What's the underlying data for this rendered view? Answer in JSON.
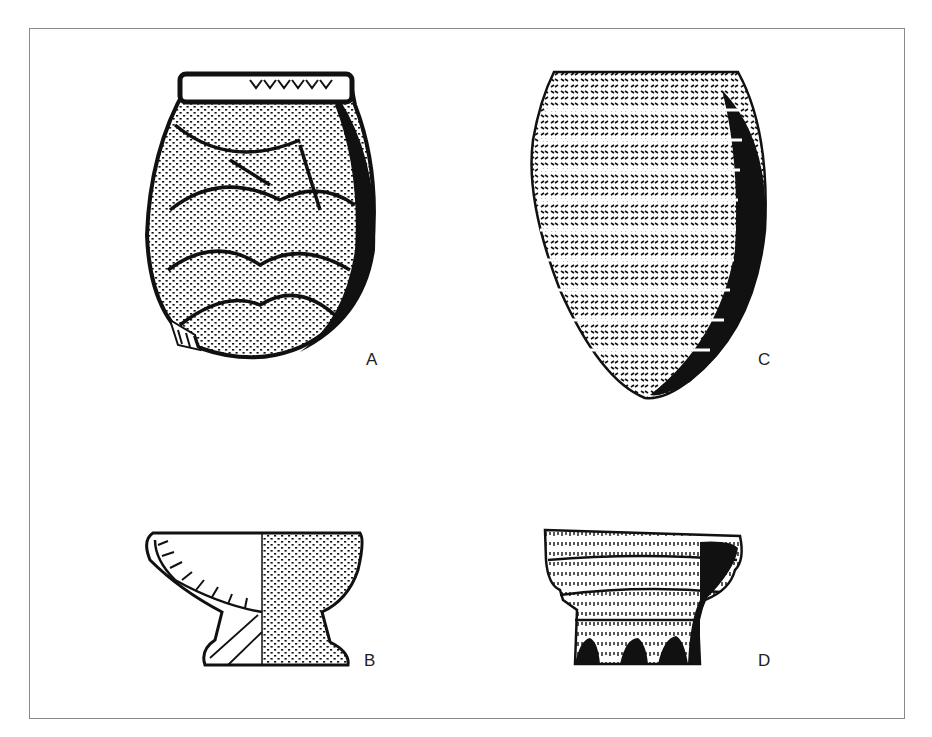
{
  "figure": {
    "panels": [
      {
        "id": "A",
        "label": "A",
        "type": "ovoid jar with scale-like impressed decoration"
      },
      {
        "id": "B",
        "label": "B",
        "type": "pedestal bowl, half section / half exterior"
      },
      {
        "id": "C",
        "label": "C",
        "type": "pointed-base vessel with horizontal herringbone rows"
      },
      {
        "id": "D",
        "label": "D",
        "type": "vessel fragment with corrugated rows and arched footing"
      }
    ]
  },
  "colors": {
    "ink": "#111111",
    "frame": "#8a8a8a",
    "background": "#ffffff"
  }
}
